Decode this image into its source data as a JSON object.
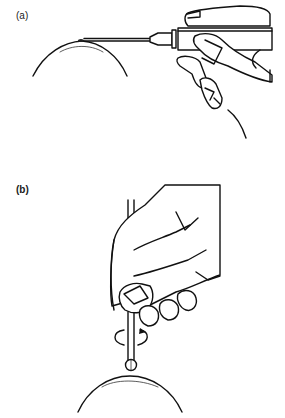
{
  "figure": {
    "panels": [
      {
        "label": "(a)",
        "description": "Syringe needle held by hand, inserted tangentially into a lesion on the curved surface of the eye"
      },
      {
        "label": "(b)",
        "description": "Rotating burr / spud held vertically between fingers, rotated over a spot on the curved surface of the eye"
      }
    ],
    "colors": {
      "line": "#111111",
      "background": "#ffffff"
    },
    "icons": [
      "rotation-arrow-icon"
    ]
  }
}
